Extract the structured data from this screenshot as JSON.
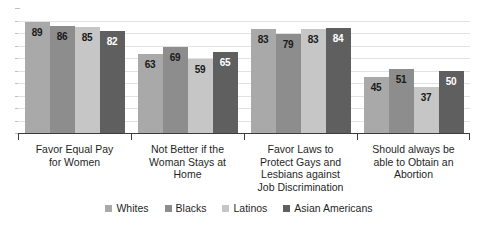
{
  "chart_data": {
    "type": "bar",
    "title": "",
    "subtitle": "",
    "xlabel": "",
    "ylabel": "",
    "ylim": [
      0,
      100
    ],
    "grid": true,
    "legend_position": "bottom",
    "categories": [
      "Favor Equal Pay for Women",
      "Not Better if the Woman Stays at Home",
      "Favor Laws to Protect Gays and Lesbians against Job Discrimination",
      "Should always be able to Obtain an Abortion"
    ],
    "category_lines": [
      [
        "Favor Equal Pay",
        "for Women"
      ],
      [
        "Not Better if the",
        "Woman Stays at",
        "Home"
      ],
      [
        "Favor Laws to",
        "Protect Gays and",
        "Lesbians against",
        "Job Discrimination"
      ],
      [
        "Should always be",
        "able to Obtain an",
        "Abortion"
      ]
    ],
    "series": [
      {
        "name": "Whites",
        "color": "#a9a9a9",
        "text_on_bar": "dark",
        "values": [
          89,
          63,
          83,
          45
        ]
      },
      {
        "name": "Blacks",
        "color": "#8d8d8d",
        "text_on_bar": "dark",
        "values": [
          86,
          69,
          79,
          51
        ]
      },
      {
        "name": "Latinos",
        "color": "#c6c6c6",
        "text_on_bar": "dark",
        "values": [
          85,
          59,
          83,
          37
        ]
      },
      {
        "name": "Asian Americans",
        "color": "#5f5f5f",
        "text_on_bar": "light",
        "values": [
          82,
          65,
          84,
          50
        ]
      }
    ],
    "gridline_count": 9,
    "y_tick_count": 10
  },
  "legend": {
    "items": [
      {
        "label": "Whites",
        "color": "#a9a9a9"
      },
      {
        "label": "Blacks",
        "color": "#8d8d8d"
      },
      {
        "label": "Latinos",
        "color": "#c6c6c6"
      },
      {
        "label": "Asian Americans",
        "color": "#5f5f5f"
      }
    ]
  }
}
